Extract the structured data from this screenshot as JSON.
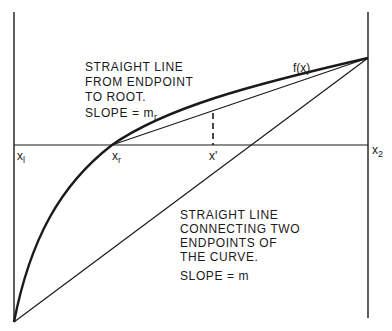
{
  "diagram": {
    "title": "",
    "colors": {
      "ink": "#1a1a1a",
      "background": "#ffffff"
    },
    "annotations": {
      "upper": {
        "lines": [
          "STRAIGHT LINE",
          "FROM ENDPOINT",
          "TO ROOT."
        ],
        "slope_label": "SLOPE = m",
        "slope_sub": "r"
      },
      "lower": {
        "lines": [
          "STRAIGHT LINE",
          "CONNECTING TWO",
          "ENDPOINTS OF",
          "THE CURVE."
        ],
        "slope_label": "SLOPE = m"
      },
      "curve_label": "f(x)"
    },
    "axis_labels": {
      "x1": {
        "base": "x",
        "sub": "l"
      },
      "xr": {
        "base": "x",
        "sub": "r"
      },
      "xprime": "x'",
      "x2": {
        "base": "x",
        "sub": "2"
      }
    },
    "elements": [
      "left vertical line at x1",
      "right vertical line at x2",
      "horizontal axis",
      "curve f(x) from bottom-left endpoint to top-right endpoint crossing axis at xr",
      "straight line from xr to top-right endpoint (slope m_r)",
      "straight line connecting both endpoints (slope m), crossing axis at x'",
      "dashed vertical from x' up to root-line"
    ]
  }
}
